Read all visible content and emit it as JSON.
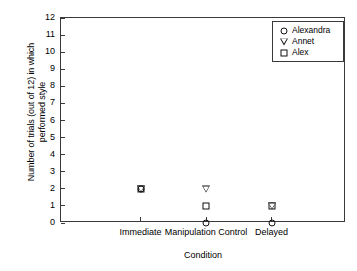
{
  "chart_data": {
    "type": "scatter",
    "title": "",
    "xlabel": "Condition",
    "ylabel_line1": "Number of trials (out of 12) in which",
    "ylabel_line2": "performed style",
    "categories": [
      "Immediate",
      "Manipulation Control",
      "Delayed"
    ],
    "ylim": [
      0,
      12
    ],
    "yticks": [
      "12",
      "11",
      "10",
      "9",
      "8",
      "7",
      "6",
      "5",
      "4",
      "3",
      "2",
      "1",
      "0"
    ],
    "grid": false,
    "legend_position": "top-right-inside",
    "series": [
      {
        "name": "Alexandra",
        "marker": "circle",
        "values": [
          2,
          0,
          0
        ]
      },
      {
        "name": "Annet",
        "marker": "triangle-down",
        "values": [
          2,
          2,
          1
        ]
      },
      {
        "name": "Alex",
        "marker": "square",
        "values": [
          2,
          1,
          1
        ]
      }
    ]
  },
  "colors": {
    "axis": "#3a3a3a",
    "marker": "#111111",
    "background": "#ffffff"
  }
}
